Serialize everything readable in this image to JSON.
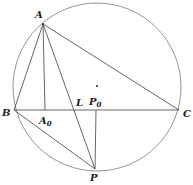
{
  "diagram": {
    "type": "geometry",
    "circle": {
      "cx": 97,
      "cy": 87,
      "r": 84,
      "color": "#888888"
    },
    "points": {
      "A": {
        "label": "A",
        "x": 43,
        "y": 24,
        "lx": 35,
        "ly": 18
      },
      "B": {
        "label": "B",
        "x": 14,
        "y": 110,
        "lx": 3,
        "ly": 116
      },
      "C": {
        "label": "C",
        "x": 179,
        "y": 110,
        "lx": 183,
        "ly": 117
      },
      "A0": {
        "label": "A",
        "sub": "0",
        "x": 45,
        "y": 110,
        "lx": 40,
        "ly": 124
      },
      "L": {
        "label": "L",
        "x": 79,
        "y": 110,
        "lx": 77,
        "ly": 106
      },
      "P0": {
        "label": "P",
        "sub": "0",
        "x": 96,
        "y": 110,
        "lx": 90,
        "ly": 106
      },
      "P": {
        "label": "P",
        "x": 95,
        "y": 169,
        "lx": 91,
        "ly": 181
      },
      "O": {
        "x": 97,
        "y": 86
      }
    },
    "segments": [
      "AB",
      "AC",
      "BC",
      "AA0",
      "AP",
      "BP",
      "P0P"
    ]
  }
}
